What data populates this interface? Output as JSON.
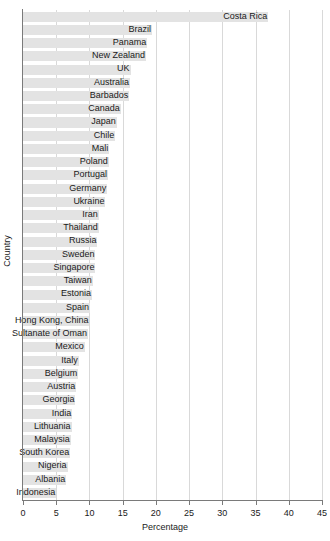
{
  "chart_data": {
    "type": "bar",
    "orientation": "horizontal",
    "title": "",
    "xlabel": "Percentage",
    "ylabel": "Country",
    "xlim": [
      0,
      45
    ],
    "xticks": [
      0,
      5,
      10,
      15,
      20,
      25,
      30,
      35,
      40,
      45
    ],
    "grid": true,
    "grid_axis": "x",
    "legend": "none",
    "bar_color": "#e3e3e3",
    "label_position": "outside-end",
    "categories": [
      "Costa Rica",
      "Brazil",
      "Panama",
      "New Zealand",
      "UK",
      "Australia",
      "Barbados",
      "Canada",
      "Japan",
      "Chile",
      "Mali",
      "Poland",
      "Portugal",
      "Germany",
      "Ukraine",
      "Iran",
      "Thailand",
      "Russia",
      "Sweden",
      "Singapore",
      "Taiwan",
      "Estonia",
      "Spain",
      "Hong Kong, China",
      "Sultanate of Oman",
      "Mexico",
      "Italy",
      "Belgium",
      "Austria",
      "Georgia",
      "India",
      "Lithuania",
      "Malaysia",
      "South Korea",
      "Nigeria",
      "Albania",
      "Indonesia"
    ],
    "values": [
      36.9,
      19.4,
      18.7,
      18.5,
      16.2,
      16.1,
      16.0,
      14.7,
      14.1,
      13.9,
      13.0,
      12.9,
      12.8,
      12.7,
      12.4,
      11.4,
      11.4,
      11.2,
      10.9,
      10.9,
      10.5,
      10.4,
      10.1,
      10.0,
      9.8,
      9.3,
      8.4,
      8.3,
      8.0,
      7.9,
      7.4,
      7.3,
      7.2,
      7.1,
      6.7,
      6.5,
      5.0
    ]
  }
}
